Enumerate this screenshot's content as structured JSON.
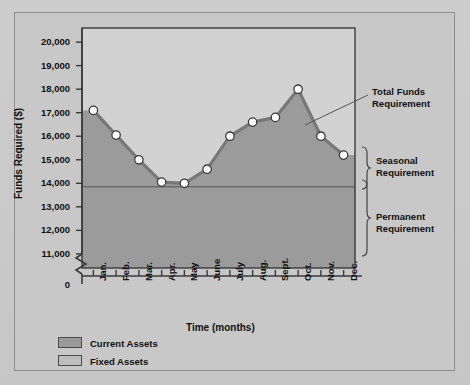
{
  "chart_data": {
    "type": "area",
    "title": "",
    "xlabel": "Time (months)",
    "ylabel": "Funds Required ($)",
    "categories": [
      "Jan.",
      "Feb.",
      "Mar.",
      "Apr.",
      "May",
      "June",
      "July",
      "Aug.",
      "Sept.",
      "Oct.",
      "Nov.",
      "Dec."
    ],
    "series": [
      {
        "name": "Total Funds Requirement",
        "values": [
          17100,
          16050,
          15000,
          14050,
          14000,
          14600,
          16000,
          16600,
          16800,
          18000,
          16000,
          15200
        ]
      }
    ],
    "permanent_requirement_level": 13850,
    "ylim": [
      10400,
      20600
    ],
    "yticks": [
      11000,
      12000,
      13000,
      14000,
      15000,
      16000,
      17000,
      18000,
      19000,
      20000
    ],
    "ytick_labels": [
      "11,000",
      "12,000",
      "13,000",
      "14,000",
      "15,000",
      "16,000",
      "17,000",
      "18,000",
      "19,000",
      "20,000"
    ],
    "origin_label": "0",
    "axis_break": true,
    "grid": false,
    "legend_position": "below-left",
    "annotations": [
      {
        "name": "total-funds-requirement",
        "text": "Total Funds\nRequirement",
        "leader_line": true
      },
      {
        "name": "seasonal-requirement",
        "text": "Seasonal\nRequirement",
        "brace": true
      },
      {
        "name": "permanent-requirement",
        "text": "Permanent\nRequirement",
        "brace": true
      }
    ],
    "colors": {
      "current_assets_fill": "#9a9a9a",
      "fixed_assets_fill": "#bdbdbd",
      "plot_background": "#d2d2d2",
      "line": "#787878",
      "marker_fill": "#ffffff",
      "marker_stroke": "#3a3a3a",
      "axis": "#3a3a3a",
      "figure_background": "#c8c8c8",
      "text": "#111111"
    }
  },
  "axis_labels": {
    "x_title": "Time (months)",
    "y_title": "Funds Required ($)",
    "origin": "0"
  },
  "annotations": {
    "total_funds_line1": "Total Funds",
    "total_funds_line2": "Requirement",
    "seasonal_line1": "Seasonal",
    "seasonal_line2": "Requirement",
    "permanent_line1": "Permanent",
    "permanent_line2": "Requirement"
  },
  "legend": {
    "items": [
      {
        "label": "Current Assets",
        "color": "#9a9a9a"
      },
      {
        "label": "Fixed Assets",
        "color": "#bdbdbd"
      }
    ]
  }
}
